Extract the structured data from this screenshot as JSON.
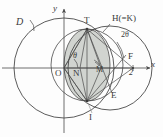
{
  "figure": {
    "width": 163,
    "height": 137,
    "background": "#fdfdfd",
    "stroke": "#4a4a4a",
    "shade_fill": "#c9cdc8"
  },
  "axes": {
    "x_label": "x",
    "y_label": "y",
    "origin_label": "O",
    "x_tick_label": "2"
  },
  "labels": {
    "circle_d": "D",
    "circle_h": "H(=K)",
    "angle_theta": "θ",
    "angle_two_theta": "2θ",
    "point_t": "T",
    "point_i": "I",
    "point_n": "N",
    "point_f": "F",
    "point_e": "E",
    "point_m": "M"
  },
  "geometry": {
    "origin": [
      64,
      68
    ],
    "focus_f": [
      133,
      68
    ],
    "point_t": [
      87,
      29
    ],
    "point_i": [
      87,
      101
    ],
    "point_n": [
      80,
      68
    ],
    "point_m": [
      98,
      68
    ],
    "circle_d": {
      "cx": 64,
      "cy": 68,
      "r": 50
    },
    "circle_h": {
      "cx": 110,
      "cy": 68,
      "r": 42
    },
    "ellipse_shaded": {
      "cx": 87,
      "cy": 65,
      "rx": 23,
      "ry": 36
    }
  }
}
